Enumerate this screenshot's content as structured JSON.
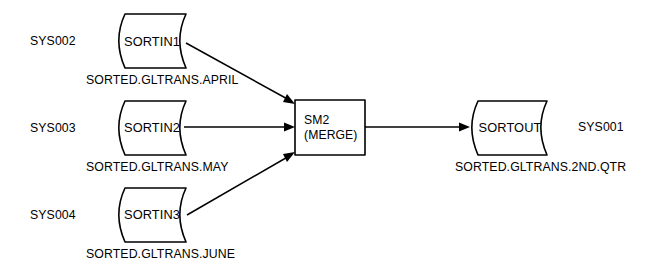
{
  "diagram": {
    "background_color": "#ffffff",
    "line_color": "#000000",
    "nodes": {
      "input1": {
        "system_id": "SYS002",
        "symbol_label": "SORTIN1",
        "dataset_name": "SORTED.GLTRANS.APRIL",
        "shape": "magnetic-tape-file"
      },
      "input2": {
        "system_id": "SYS003",
        "symbol_label": "SORTIN2",
        "dataset_name": "SORTED.GLTRANS.MAY",
        "shape": "magnetic-tape-file"
      },
      "input3": {
        "system_id": "SYS004",
        "symbol_label": "SORTIN3",
        "dataset_name": "SORTED.GLTRANS.JUNE",
        "shape": "magnetic-tape-file"
      },
      "process": {
        "label_line1": "SM2",
        "label_line2": "(MERGE)",
        "shape": "process-rectangle"
      },
      "output": {
        "system_id": "SYS001",
        "symbol_label": "SORTOUT",
        "dataset_name": "SORTED.GLTRANS.2ND.QTR",
        "shape": "magnetic-tape-file"
      }
    }
  }
}
